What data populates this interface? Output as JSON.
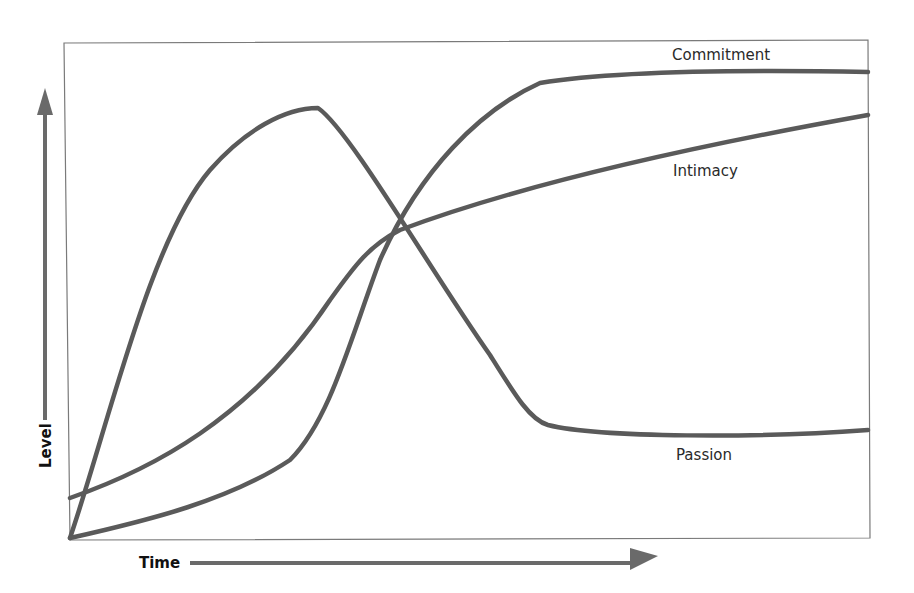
{
  "chart_data": {
    "type": "line",
    "title": "",
    "xlabel": "Time",
    "ylabel": "Level",
    "grid": false,
    "legend": "inline labels",
    "x_range": [
      0,
      100
    ],
    "y_range": [
      0,
      100
    ],
    "series": [
      {
        "name": "Passion",
        "description": "rises rapidly to a peak early, then falls sharply and levels off low",
        "points": [
          [
            0,
            0
          ],
          [
            10,
            48
          ],
          [
            20,
            78
          ],
          [
            30,
            87
          ],
          [
            32,
            86
          ],
          [
            45,
            55
          ],
          [
            57,
            22
          ],
          [
            60,
            20
          ],
          [
            75,
            19
          ],
          [
            100,
            21
          ]
        ]
      },
      {
        "name": "Intimacy",
        "description": "starts above zero and rises steadily throughout, slowing over time",
        "points": [
          [
            0,
            8
          ],
          [
            10,
            14
          ],
          [
            20,
            24
          ],
          [
            30,
            38
          ],
          [
            39,
            60
          ],
          [
            50,
            69
          ],
          [
            75,
            78
          ],
          [
            100,
            85
          ]
        ]
      },
      {
        "name": "Commitment",
        "description": "starts at zero, rises slowly then steeply in the middle, then plateaus high",
        "points": [
          [
            0,
            0
          ],
          [
            10,
            5
          ],
          [
            20,
            12
          ],
          [
            28,
            30
          ],
          [
            40,
            70
          ],
          [
            55,
            91
          ],
          [
            70,
            93
          ],
          [
            100,
            93
          ]
        ]
      }
    ],
    "annotations": [
      {
        "text": "Commitment",
        "near": "top-right, above commitment curve"
      },
      {
        "text": "Intimacy",
        "near": "right, below intimacy curve"
      },
      {
        "text": "Passion",
        "near": "bottom-right, below passion curve"
      }
    ]
  },
  "labels": {
    "commitment": "Commitment",
    "intimacy": "Intimacy",
    "passion": "Passion",
    "x_axis": "Time",
    "y_axis": "Level"
  },
  "paths": {
    "frame": "M64,43 L868,40 L870,538 L70,540 Z",
    "passion": "M70,538 C110,420 150,240 210,170 C245,130 285,108 318,108 C350,130 430,270 490,355 C515,395 530,420 548,425 C600,438 760,438 868,430",
    "intimacy": "M70,498 C150,470 250,420 330,300 C355,265 370,245 400,230 C520,185 700,145 868,115",
    "commitment": "M70,538 C150,520 230,500 290,460 C330,420 350,340 380,260 C420,170 480,110 540,83 C620,70 760,70 868,72",
    "y_arrow_shaft": "M45,420 L45,115",
    "y_arrow_head": "M45,88 L37,115 L53,115 Z",
    "x_arrow_shaft": "M190,563 L635,563",
    "x_arrow_head": "M658,556 L630,548 L630,570 Z"
  },
  "colors": {
    "curve": "#5a5a5a",
    "frame": "#7a7a7a",
    "arrow": "#6a6a6a",
    "text": "#2a2a2a"
  }
}
